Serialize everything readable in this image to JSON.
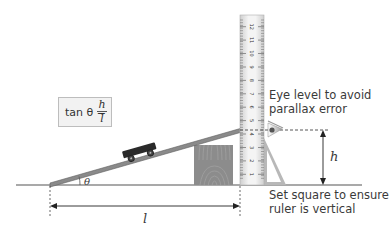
{
  "diagram": {
    "formula": {
      "prefix": "tan θ =",
      "numerator": "h",
      "denominator": "l"
    },
    "labels": {
      "eye_level": [
        "Eye level to avoid",
        "parallax error"
      ],
      "set_square": [
        "Set square to ensure",
        "ruler is vertical"
      ],
      "height": "h",
      "length": "l",
      "angle": "θ"
    },
    "ruler": {
      "ticks": [
        "12",
        "11",
        "10",
        "9",
        "8",
        "7",
        "6",
        "5",
        "4",
        "3",
        "2",
        "1"
      ]
    },
    "colors": {
      "ground": "#555555",
      "ramp": "#7a7a7a",
      "cart": "#2a2a2a",
      "block": "#8a8a8a",
      "ruler": "#e2e2e2",
      "set_square": "#b5b5b5",
      "formula_bg": "#f2f2f2"
    }
  }
}
